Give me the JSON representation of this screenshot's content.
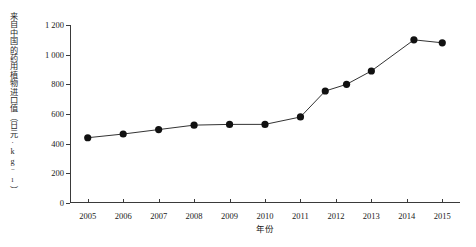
{
  "chart_data": {
    "type": "line",
    "title": "",
    "xlabel": "年份",
    "ylabel": "来自中国的药用植物进口值（日元·kg⁻¹）",
    "xlim": [
      2004.5,
      2015.5
    ],
    "ylim": [
      0,
      1200
    ],
    "xticks": [
      2005,
      2006,
      2007,
      2008,
      2009,
      2010,
      2011,
      2012,
      2013,
      2014,
      2015
    ],
    "xtick_labels": [
      "2005",
      "2006",
      "2007",
      "2008",
      "2009",
      "2010",
      "2011",
      "2012",
      "2013",
      "2014",
      "2015"
    ],
    "yticks": [
      0,
      200,
      400,
      600,
      800,
      1000,
      1200
    ],
    "ytick_labels": [
      "0",
      "200",
      "400",
      "600",
      "800",
      "1 000",
      "1 200"
    ],
    "grid": false,
    "legend": false,
    "marker": "filled-circle",
    "marker_color": "#111111",
    "line_color": "#333333",
    "series": [
      {
        "name": "来自中国的药用植物进口值",
        "x": [
          2005,
          2006,
          2007,
          2008,
          2009,
          2010,
          2011,
          2011.7,
          2012.3,
          2013,
          2014.2,
          2015
        ],
        "values": [
          440,
          465,
          495,
          525,
          530,
          530,
          580,
          755,
          800,
          890,
          1100,
          1080
        ]
      }
    ]
  },
  "axes": {
    "y_axis_title": "来自中国的药用植物进口值（日元·kg⁻¹）",
    "x_axis_title": "年份"
  }
}
